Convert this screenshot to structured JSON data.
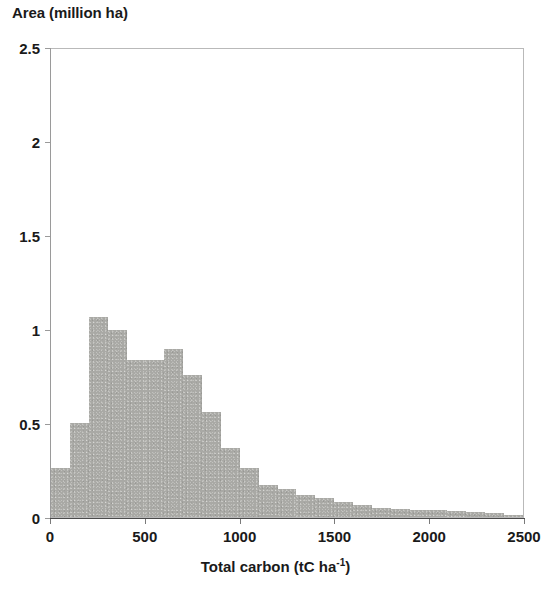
{
  "chart_data": {
    "type": "bar",
    "title": "",
    "subtitle": "",
    "ylabel": "Area (million ha)",
    "xlabel_main": "Total carbon (tC ha",
    "xlabel_sup": "-1",
    "xlabel_tail": ")",
    "xlabel_full": "Total carbon (tC ha-1)",
    "xlim": [
      0,
      2500
    ],
    "ylim": [
      0,
      2.5
    ],
    "grid": false,
    "legend": null,
    "bar_color": "#a9a9a5",
    "axis_color": "#4a4a4a",
    "bin_width": 100,
    "y_ticks": [
      {
        "value": 0,
        "label": "0"
      },
      {
        "value": 0.5,
        "label": "0.5"
      },
      {
        "value": 1,
        "label": "1"
      },
      {
        "value": 1.5,
        "label": "1.5"
      },
      {
        "value": 2,
        "label": "2"
      },
      {
        "value": 2.5,
        "label": "2.5"
      }
    ],
    "x_ticks": [
      {
        "value": 0,
        "label": "0"
      },
      {
        "value": 500,
        "label": "500"
      },
      {
        "value": 1000,
        "label": "1000"
      },
      {
        "value": 1500,
        "label": "1500"
      },
      {
        "value": 2000,
        "label": "2000"
      },
      {
        "value": 2500,
        "label": "2500"
      }
    ],
    "bin_starts": [
      0,
      100,
      200,
      300,
      400,
      500,
      600,
      700,
      800,
      900,
      1000,
      1100,
      1200,
      1300,
      1400,
      1500,
      1600,
      1700,
      1800,
      1900,
      2000,
      2100,
      2200,
      2300,
      2400
    ],
    "categories": [
      "0-100",
      "100-200",
      "200-300",
      "300-400",
      "400-500",
      "500-600",
      "600-700",
      "700-800",
      "800-900",
      "900-1000",
      "1000-1100",
      "1100-1200",
      "1200-1300",
      "1300-1400",
      "1400-1500",
      "1500-1600",
      "1600-1700",
      "1700-1800",
      "1800-1900",
      "1900-2000",
      "2000-2100",
      "2100-2200",
      "2200-2300",
      "2300-2400",
      "2400-2500"
    ],
    "values": [
      0.26,
      0.5,
      1.07,
      1.0,
      0.84,
      0.84,
      0.9,
      0.76,
      0.56,
      0.37,
      0.26,
      0.17,
      0.15,
      0.12,
      0.1,
      0.08,
      0.065,
      0.05,
      0.045,
      0.04,
      0.035,
      0.03,
      0.025,
      0.02,
      0.012
    ]
  }
}
